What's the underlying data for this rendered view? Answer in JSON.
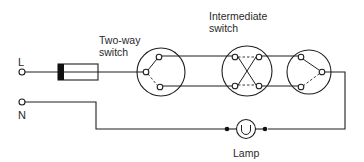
{
  "diagram": {
    "type": "wiring-diagram",
    "labels": {
      "live": "L",
      "neutral": "N",
      "two_way_switch_line1": "Two-way",
      "two_way_switch_line2": "switch",
      "intermediate_switch_line1": "Intermediate",
      "intermediate_switch_line2": "switch",
      "lamp": "Lamp"
    },
    "components": [
      {
        "id": "live-terminal",
        "kind": "terminal",
        "label": "L"
      },
      {
        "id": "neutral-terminal",
        "kind": "terminal",
        "label": "N"
      },
      {
        "id": "fuse",
        "kind": "fuse"
      },
      {
        "id": "two-way-switch-1",
        "kind": "two-way switch",
        "label": "Two-way switch"
      },
      {
        "id": "intermediate-switch",
        "kind": "intermediate switch",
        "label": "Intermediate switch"
      },
      {
        "id": "two-way-switch-2",
        "kind": "two-way switch"
      },
      {
        "id": "lamp",
        "kind": "lamp",
        "label": "Lamp"
      }
    ],
    "connections": [
      [
        "live-terminal",
        "fuse"
      ],
      [
        "fuse",
        "two-way-switch-1"
      ],
      [
        "two-way-switch-1",
        "intermediate-switch"
      ],
      [
        "intermediate-switch",
        "two-way-switch-2"
      ],
      [
        "two-way-switch-2",
        "lamp"
      ],
      [
        "lamp",
        "neutral-terminal"
      ]
    ],
    "colors": {
      "line": "#1f1f1f",
      "text": "#2a2a2a",
      "background": "#ffffff"
    }
  }
}
